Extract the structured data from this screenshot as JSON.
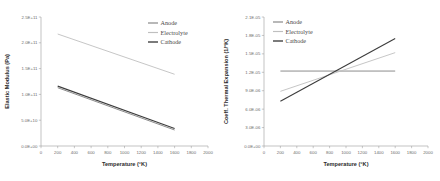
{
  "figure": {
    "name": "two-panel-material-properties-figure",
    "background": "#ffffff"
  },
  "colors": {
    "anode": "#8d8d8d",
    "electrolyte": "#bfbfbf",
    "cathode": "#3c3c3c",
    "axis": "#9a9a9a",
    "text": "#5f5f5f",
    "title": "#2b2b2b"
  },
  "chart_data": [
    {
      "id": "elastic-modulus-chart",
      "type": "line",
      "title": "",
      "xlabel": "Temperature (°K)",
      "ylabel": "Elastic Modulus (Pa)",
      "xlim": [
        0,
        2000
      ],
      "ylim": [
        0,
        250000000000
      ],
      "xticks": [
        0,
        200,
        400,
        600,
        800,
        1000,
        1200,
        1400,
        1600,
        1800,
        2000
      ],
      "xticklabels": [
        "0",
        "200",
        "400",
        "600",
        "800",
        "1000",
        "1200",
        "1400",
        "1600",
        "1800",
        "2000"
      ],
      "yticks": [
        0,
        50000000000,
        100000000000,
        150000000000,
        200000000000,
        250000000000
      ],
      "yticklabels": [
        "0.0E+00",
        "5.0E+10",
        "1.0E+11",
        "1.5E+11",
        "2.0E+11",
        "2.5E+11"
      ],
      "grid": false,
      "legend_position": "top-right",
      "series": [
        {
          "name": "Anode",
          "color": "#8d8d8d",
          "width": 1.0,
          "x": [
            200,
            1600
          ],
          "values": [
            113000000000,
            31000000000
          ]
        },
        {
          "name": "Electrolyte",
          "color": "#bfbfbf",
          "width": 0.9,
          "x": [
            200,
            1600
          ],
          "values": [
            217000000000,
            139000000000
          ]
        },
        {
          "name": "Cathode",
          "color": "#3c3c3c",
          "width": 1.1,
          "x": [
            200,
            1600
          ],
          "values": [
            116000000000,
            34000000000
          ]
        }
      ]
    },
    {
      "id": "thermal-expansion-chart",
      "type": "line",
      "title": "",
      "xlabel": "Temperature (°K)",
      "ylabel": "Coeff. Thermal Expansion (1/°K)",
      "xlim": [
        0,
        2000
      ],
      "ylim": [
        0,
        2.1e-05
      ],
      "xticks": [
        0,
        200,
        400,
        600,
        800,
        1000,
        1200,
        1400,
        1600,
        1800,
        2000
      ],
      "xticklabels": [
        "0",
        "200",
        "400",
        "600",
        "800",
        "1000",
        "1200",
        "1400",
        "1600",
        "1800",
        "2000"
      ],
      "yticks": [
        0,
        3e-06,
        6e-06,
        9e-06,
        1.2e-05,
        1.5e-05,
        1.8e-05,
        2.1e-05
      ],
      "yticklabels": [
        "0.0E+00",
        "3.0E-06",
        "6.0E-06",
        "9.0E-06",
        "1.2E-05",
        "1.5E-05",
        "1.8E-05",
        "2.1E-05"
      ],
      "grid": false,
      "legend_position": "top-left",
      "series": [
        {
          "name": "Anode",
          "color": "#8d8d8d",
          "width": 1.0,
          "x": [
            200,
            1600
          ],
          "values": [
            1.22e-05,
            1.22e-05
          ]
        },
        {
          "name": "Electrolyte",
          "color": "#bfbfbf",
          "width": 0.9,
          "x": [
            200,
            1600
          ],
          "values": [
            8.9e-06,
            1.52e-05
          ]
        },
        {
          "name": "Cathode",
          "color": "#3c3c3c",
          "width": 1.1,
          "x": [
            200,
            1600
          ],
          "values": [
            7.3e-06,
            1.75e-05
          ]
        }
      ]
    }
  ]
}
